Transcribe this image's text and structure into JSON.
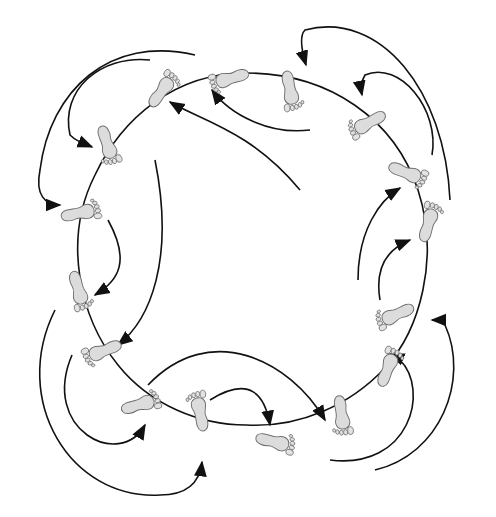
{
  "diagram": {
    "loop_shape": "rounded-circle",
    "colors": {
      "line": "#111111",
      "footprint_fill": "#dcdcdc",
      "footprint_stroke": "#6e6e6e",
      "background": "#ffffff"
    },
    "footprint_count": 16,
    "arrow_count": 16,
    "footprints": [
      {
        "id": "f1",
        "side": "left",
        "toe_direction": "up-right"
      },
      {
        "id": "f2",
        "side": "right",
        "toe_direction": "left"
      },
      {
        "id": "f3",
        "side": "left",
        "toe_direction": "down"
      },
      {
        "id": "f4",
        "side": "right",
        "toe_direction": "down"
      },
      {
        "id": "f5",
        "side": "left",
        "toe_direction": "down-left"
      },
      {
        "id": "f6",
        "side": "right",
        "toe_direction": "right"
      },
      {
        "id": "f7",
        "side": "left",
        "toe_direction": "right"
      },
      {
        "id": "f8",
        "side": "right",
        "toe_direction": "down"
      },
      {
        "id": "f9",
        "side": "left",
        "toe_direction": "up"
      },
      {
        "id": "f10",
        "side": "right",
        "toe_direction": "left"
      },
      {
        "id": "f11",
        "side": "left",
        "toe_direction": "down-left"
      },
      {
        "id": "f12",
        "side": "right",
        "toe_direction": "right"
      },
      {
        "id": "f13",
        "side": "left",
        "toe_direction": "up"
      },
      {
        "id": "f14",
        "side": "right",
        "toe_direction": "up"
      },
      {
        "id": "f15",
        "side": "left",
        "toe_direction": "down"
      },
      {
        "id": "f16",
        "side": "right",
        "toe_direction": "right"
      }
    ]
  }
}
